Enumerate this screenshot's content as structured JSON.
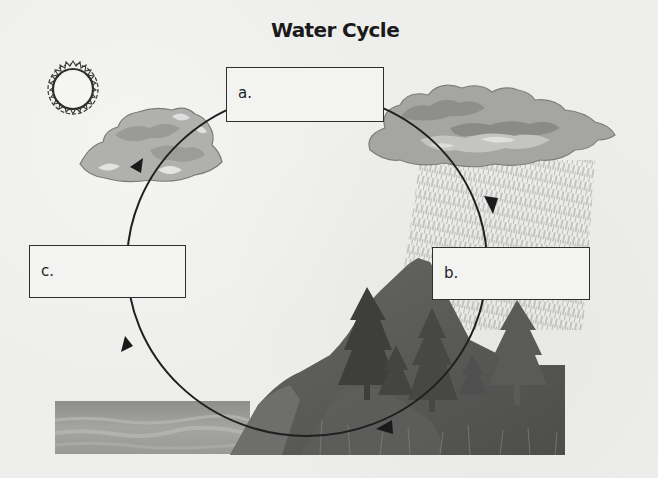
{
  "diagram": {
    "title": "Water Cycle",
    "labels": {
      "a": {
        "letter": "a.",
        "answer": ""
      },
      "b": {
        "letter": "b.",
        "answer": ""
      },
      "c": {
        "letter": "c.",
        "answer": ""
      }
    },
    "elements": [
      "sun",
      "small cloud (evaporated water vapor)",
      "rain cloud with rain",
      "mountain with evergreen trees",
      "ocean / body of water"
    ],
    "cycle_direction": "clockwise",
    "arrows": [
      {
        "position": "upper-right",
        "direction": "down"
      },
      {
        "position": "bottom",
        "direction": "left"
      },
      {
        "position": "lower-left",
        "direction": "up"
      },
      {
        "position": "upper-left",
        "direction": "up-right"
      }
    ],
    "colors": {
      "background": "#eeeeec",
      "line": "#1f1f1f",
      "cloud_light": "#c9c9c7",
      "cloud_dark": "#8f8f8d",
      "land": "#5a5a58",
      "water": "#9a9a98"
    }
  }
}
